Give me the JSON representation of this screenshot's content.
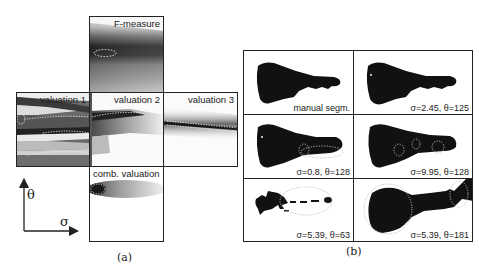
{
  "figure_a": {
    "caption": "(a)",
    "panels": {
      "f_measure": "F-measure",
      "valuation_1": "valuation 1",
      "valuation_2": "valuation 2",
      "valuation_3": "valuation 3",
      "comb_valuation": "comb. valuation"
    },
    "axes": {
      "vertical": "θ",
      "horizontal": "σ"
    }
  },
  "figure_b": {
    "caption": "(b)",
    "cells": [
      {
        "label": "manual segm."
      },
      {
        "label": "σ=2.45, θ=125"
      },
      {
        "label": "σ=0.8, θ=128"
      },
      {
        "label": "σ=9.95, θ=128"
      },
      {
        "label": "σ=5.39, θ=63"
      },
      {
        "label": "σ=5.39, θ=181"
      }
    ]
  }
}
